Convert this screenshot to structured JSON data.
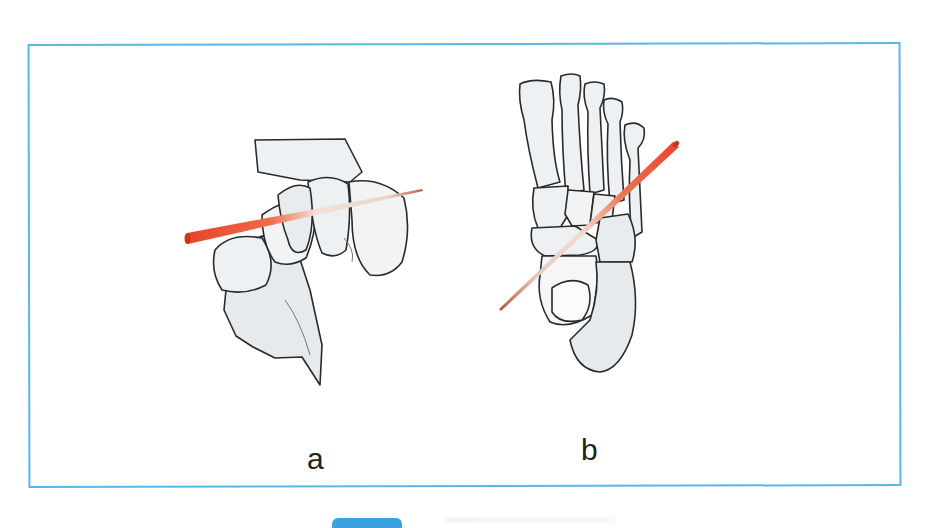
{
  "figure": {
    "panels": [
      {
        "id": "a",
        "label": "a",
        "subject": "hindfoot-midfoot bones, oblique view, with guide wire",
        "guide_wire_color": "#e8442a"
      },
      {
        "id": "b",
        "label": "b",
        "subject": "foot skeleton, dorsal view, with guide wire",
        "guide_wire_color": "#e8442a"
      }
    ],
    "frame_color": "#5bb6e6",
    "bone_fill": "#eceff1",
    "bone_shade": "#cfd3d6",
    "outline_color": "#2a2a2a"
  },
  "footer": {
    "tab_color": "#3aa3df"
  }
}
